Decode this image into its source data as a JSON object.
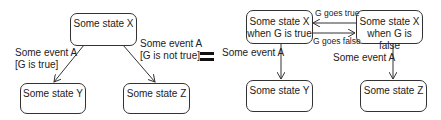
{
  "left_diagram": {
    "states": {
      "x": "Some state X",
      "y": "Some state Y",
      "z": "Some state Z"
    },
    "transitions": {
      "x_to_y": {
        "event": "Some event A",
        "guard": "[G is true]"
      },
      "x_to_z": {
        "event": "Some event A",
        "guard": "[G is not true]"
      }
    }
  },
  "equals_symbol": "=",
  "right_diagram": {
    "states": {
      "x_true_line1": "Some state X",
      "x_true_line2": "when G is true",
      "x_false_line1": "Some state X",
      "x_false_line2": "when G is false",
      "y": "Some state Y",
      "z": "Some state Z"
    },
    "transitions": {
      "false_to_true": "G goes true",
      "true_to_false": "G goes false",
      "x_true_to_y": "Some event A",
      "x_false_to_z": "Some event A"
    }
  },
  "colors": {
    "stroke": "#333333",
    "text": "#222222",
    "background": "#ffffff"
  }
}
